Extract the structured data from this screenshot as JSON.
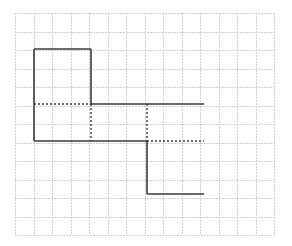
{
  "diagram": {
    "type": "grid-figure",
    "grid": {
      "origin_x": 15,
      "origin_y": 13,
      "cell": 18.5,
      "cols": 14,
      "rows": 12,
      "line_color": "#cfcfcf",
      "style": "dotted"
    },
    "solid_color": "#3a3a3a",
    "dotted_color": "#3a3a3a",
    "solid_segments": [
      {
        "x1": 34,
        "y1": 49,
        "x2": 91,
        "y2": 49
      },
      {
        "x1": 34,
        "y1": 49,
        "x2": 34,
        "y2": 141
      },
      {
        "x1": 91,
        "y1": 49,
        "x2": 91,
        "y2": 104
      },
      {
        "x1": 91,
        "y1": 104,
        "x2": 204,
        "y2": 104
      },
      {
        "x1": 34,
        "y1": 141,
        "x2": 147,
        "y2": 141
      },
      {
        "x1": 147,
        "y1": 141,
        "x2": 147,
        "y2": 194
      },
      {
        "x1": 147,
        "y1": 194,
        "x2": 204,
        "y2": 194
      }
    ],
    "dotted_segments": [
      {
        "x1": 34,
        "y1": 104,
        "x2": 91,
        "y2": 104
      },
      {
        "x1": 91,
        "y1": 104,
        "x2": 91,
        "y2": 141
      },
      {
        "x1": 147,
        "y1": 104,
        "x2": 147,
        "y2": 141
      },
      {
        "x1": 147,
        "y1": 141,
        "x2": 204,
        "y2": 141
      }
    ]
  }
}
